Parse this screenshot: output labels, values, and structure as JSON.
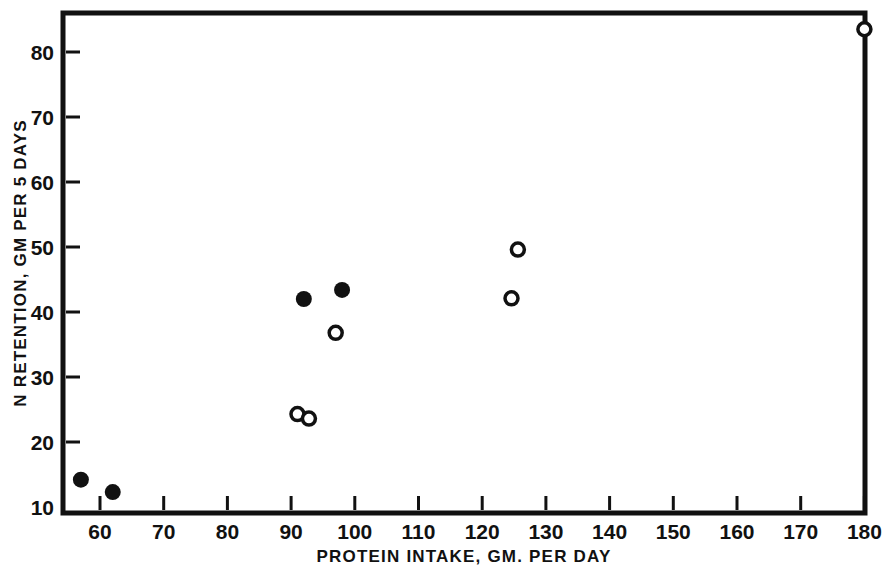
{
  "chart_data": {
    "type": "scatter",
    "title": "",
    "xlabel": "PROTEIN  INTAKE,  GM. PER  DAY",
    "ylabel": "N  RETENTION,  GM  PER  5   DAYS",
    "xlim": [
      55,
      180
    ],
    "ylim": [
      10,
      85
    ],
    "grid": false,
    "legend_position": "none",
    "x_ticks": [
      60,
      70,
      80,
      90,
      100,
      110,
      120,
      130,
      140,
      150,
      160,
      170,
      180
    ],
    "x_tick_labels": [
      "60",
      "70",
      "80",
      "90",
      "100",
      "110",
      "120",
      "130",
      "140",
      "150",
      "160",
      "170",
      "180"
    ],
    "y_ticks": [
      10,
      20,
      30,
      40,
      50,
      60,
      70,
      80
    ],
    "y_tick_labels": [
      "10",
      "20",
      "30",
      "40",
      "50",
      "60",
      "70",
      "80"
    ],
    "series": [
      {
        "name": "filled",
        "marker": "filled-circle",
        "color": "#111111",
        "points": [
          {
            "x": 57.0,
            "y": 14.2
          },
          {
            "x": 62.0,
            "y": 12.3
          },
          {
            "x": 92.0,
            "y": 42.0
          },
          {
            "x": 98.0,
            "y": 43.4
          }
        ]
      },
      {
        "name": "open",
        "marker": "open-circle",
        "color": "#111111",
        "points": [
          {
            "x": 91.0,
            "y": 24.3
          },
          {
            "x": 92.8,
            "y": 23.6
          },
          {
            "x": 97.0,
            "y": 36.8
          },
          {
            "x": 124.6,
            "y": 42.1
          },
          {
            "x": 125.6,
            "y": 49.6
          },
          {
            "x": 180.0,
            "y": 83.5
          }
        ]
      }
    ]
  },
  "figure": {
    "background_color": "#ffffff",
    "axis_color": "#111111"
  }
}
